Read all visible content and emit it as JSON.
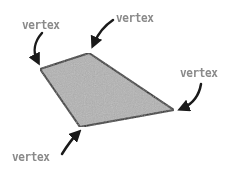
{
  "diagram": {
    "shape": "quadrilateral",
    "fill_color": "#b3b3b3",
    "stroke_color": "#2a2a2a",
    "label_color": "#8a8a8a",
    "vertices": [
      {
        "x": 40,
        "y": 69
      },
      {
        "x": 89,
        "y": 53
      },
      {
        "x": 174,
        "y": 110
      },
      {
        "x": 80,
        "y": 127
      }
    ],
    "labels": [
      {
        "text": "vertex",
        "x": 22,
        "y": 18
      },
      {
        "text": "vertex",
        "x": 116,
        "y": 11
      },
      {
        "text": "vertex",
        "x": 180,
        "y": 66
      },
      {
        "text": "vertex",
        "x": 12,
        "y": 150
      }
    ]
  }
}
